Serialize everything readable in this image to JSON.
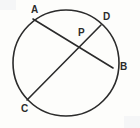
{
  "figure": {
    "kind": "circle-with-two-intersecting-chords",
    "canvas": {
      "width": 140,
      "height": 128
    },
    "background_color": "#fdfdfb",
    "stroke_color": "#2b2b2b",
    "label_color": "#2b2b2b"
  },
  "circle": {
    "name": "circle",
    "center_x": 66,
    "center_y": 63,
    "radius": 53,
    "stroke_width": 1.6
  },
  "chords": [
    {
      "name": "chord-AB",
      "from": "A",
      "to": "B",
      "x1": 33,
      "y1": 19,
      "x2": 113,
      "y2": 68,
      "stroke_width": 1.6
    },
    {
      "name": "chord-CD",
      "from": "C",
      "to": "D",
      "x1": 27,
      "y1": 100,
      "x2": 101,
      "y2": 25,
      "stroke_width": 1.6
    }
  ],
  "points": [
    {
      "id": "A",
      "label": "A",
      "x": 33,
      "y": 19,
      "label_x": 31,
      "label_y": 5,
      "on_circle": true
    },
    {
      "id": "D",
      "label": "D",
      "x": 101,
      "y": 25,
      "label_x": 103,
      "label_y": 12,
      "on_circle": true
    },
    {
      "id": "P",
      "label": "P",
      "x": 82,
      "y": 42,
      "label_x": 78,
      "label_y": 28,
      "on_circle": false
    },
    {
      "id": "B",
      "label": "B",
      "x": 113,
      "y": 68,
      "label_x": 120,
      "label_y": 62,
      "on_circle": true
    },
    {
      "id": "C",
      "label": "C",
      "x": 27,
      "y": 100,
      "label_x": 21,
      "label_y": 104,
      "on_circle": true
    }
  ],
  "labels": {
    "A": "A",
    "B": "B",
    "C": "C",
    "D": "D",
    "P": "P"
  }
}
